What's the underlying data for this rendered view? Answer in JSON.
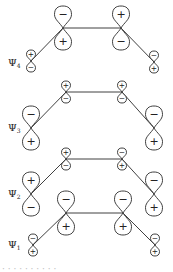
{
  "figure": {
    "colors": {
      "line": "#2a2a2a",
      "background": "#ffffff"
    },
    "orbitals": [
      {
        "label": "Ψ",
        "subscript": "4",
        "label_pos": [
          8,
          66
        ],
        "atoms": [
          {
            "x": 31,
            "y": 61,
            "size": "small",
            "top": "+",
            "bottom": "−"
          },
          {
            "x": 63,
            "y": 28,
            "size": "large",
            "top": "−",
            "bottom": "+"
          },
          {
            "x": 121,
            "y": 28,
            "size": "large",
            "top": "+",
            "bottom": "−"
          },
          {
            "x": 154,
            "y": 62,
            "size": "small",
            "top": "−",
            "bottom": "+"
          }
        ]
      },
      {
        "label": "Ψ",
        "subscript": "3",
        "label_pos": [
          8,
          131
        ],
        "atoms": [
          {
            "x": 31,
            "y": 128,
            "size": "large",
            "top": "−",
            "bottom": "+"
          },
          {
            "x": 66,
            "y": 92,
            "size": "small",
            "top": "+",
            "bottom": "−"
          },
          {
            "x": 122,
            "y": 92,
            "size": "small",
            "top": "+",
            "bottom": "−"
          },
          {
            "x": 154,
            "y": 128,
            "size": "large",
            "top": "−",
            "bottom": "+"
          }
        ]
      },
      {
        "label": "Ψ",
        "subscript": "2",
        "label_pos": [
          8,
          197
        ],
        "atoms": [
          {
            "x": 31,
            "y": 194,
            "size": "large",
            "top": "+",
            "bottom": "−"
          },
          {
            "x": 66,
            "y": 159,
            "size": "small",
            "top": "+",
            "bottom": "−"
          },
          {
            "x": 122,
            "y": 159,
            "size": "small",
            "top": "−",
            "bottom": "+"
          },
          {
            "x": 154,
            "y": 194,
            "size": "large",
            "top": "−",
            "bottom": "+"
          }
        ]
      },
      {
        "label": "Ψ",
        "subscript": "1",
        "label_pos": [
          8,
          248
        ],
        "atoms": [
          {
            "x": 33,
            "y": 245,
            "size": "small",
            "top": "−",
            "bottom": "+"
          },
          {
            "x": 66,
            "y": 213,
            "size": "large",
            "top": "−",
            "bottom": "+"
          },
          {
            "x": 123,
            "y": 213,
            "size": "large",
            "top": "−",
            "bottom": "+"
          },
          {
            "x": 155,
            "y": 245,
            "size": "small",
            "top": "−",
            "bottom": "+"
          }
        ]
      }
    ],
    "caption": "· · · · · · · · · ·"
  }
}
